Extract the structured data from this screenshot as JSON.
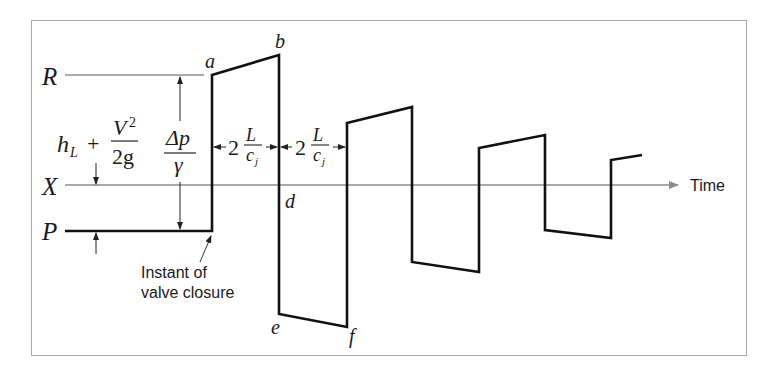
{
  "diagram": {
    "type": "water-hammer pressure-time diagram",
    "levels": {
      "R": "R",
      "X": "X",
      "P": "P"
    },
    "points": {
      "a": "a",
      "b": "b",
      "d": "d",
      "e": "e",
      "f": "f"
    },
    "labels": {
      "head_loss": {
        "h": "h",
        "sub": "L",
        "plus": "+",
        "num": "V",
        "sup": "2",
        "den": "2g"
      },
      "pressure_rise": {
        "num": "Δp",
        "den": "γ"
      },
      "interval1": {
        "coef": "2",
        "num": "L",
        "den": "c",
        "sub": "j"
      },
      "interval2": {
        "coef": "2",
        "num": "L",
        "den": "c",
        "sub": "j"
      },
      "time_axis": "Time",
      "annotation_line1": "Instant of",
      "annotation_line2": "valve closure"
    },
    "colors": {
      "waveform": "#111111",
      "axis": "#8c8c8c",
      "frame": "#a8a8a8"
    }
  }
}
